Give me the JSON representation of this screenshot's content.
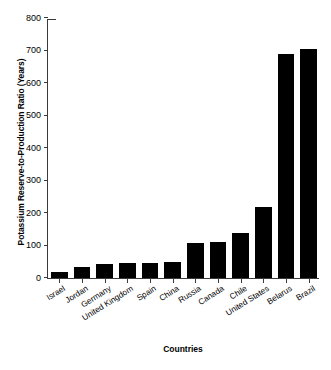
{
  "chart_data": {
    "type": "bar",
    "title": "",
    "xlabel": "Countries",
    "ylabel": "Potassium Reserve-to-Production Ratio (Years)",
    "categories": [
      "Israel",
      "Jordan",
      "Germany",
      "United Kingdom",
      "Spain",
      "China",
      "Russia",
      "Canada",
      "Chile",
      "United States",
      "Belarus",
      "Brazil"
    ],
    "values": [
      18,
      35,
      43,
      45,
      45,
      48,
      108,
      110,
      140,
      220,
      690,
      705
    ],
    "ylim": [
      0,
      800
    ],
    "yticks": [
      0,
      100,
      200,
      300,
      400,
      500,
      600,
      700,
      800
    ],
    "ytick_labels": [
      "0",
      "100",
      "200",
      "300",
      "400",
      "500",
      "600",
      "700",
      "800"
    ],
    "grid": false,
    "legend": null,
    "bar_color": "#000000",
    "axis_color": "#3a3a3a",
    "background": "#ffffff"
  }
}
